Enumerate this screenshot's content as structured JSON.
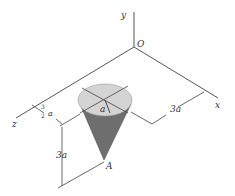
{
  "diagram": {
    "axes": {
      "y": "y",
      "x": "x",
      "z": "z",
      "origin": "O"
    },
    "labels": {
      "radius": "a",
      "offset_num": "3",
      "offset_den": "2",
      "offset_var": "a",
      "height": "3a",
      "x_distance": "3a",
      "apex": "A"
    },
    "colors": {
      "cone_side": "#6e6e6e",
      "cone_top": "#d4d4d4",
      "line": "#444444"
    }
  }
}
